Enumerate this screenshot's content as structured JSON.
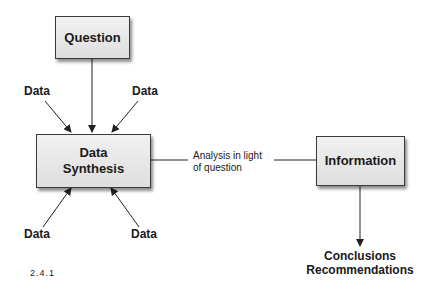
{
  "diagram": {
    "nodes": {
      "question": "Question",
      "synthesis_line1": "Data",
      "synthesis_line2": "Synthesis",
      "information": "Information"
    },
    "data_inputs": [
      "Data",
      "Data",
      "Data",
      "Data"
    ],
    "edge_label_line1": "Analysis in light",
    "edge_label_line2": "of question",
    "outputs_line1": "Conclusions",
    "outputs_line2": "Recommendations",
    "figure_number": "2.4.1"
  }
}
